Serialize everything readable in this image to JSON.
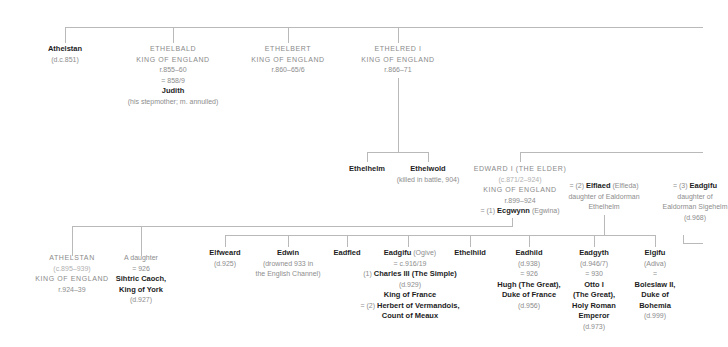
{
  "generation1": {
    "athelstan_elder": {
      "name": "Athelstan",
      "dates": "(d.c.851)"
    },
    "ethelbald": {
      "name": "ETHELBALD",
      "title": "KING OF ENGLAND",
      "reign": "r.855–60",
      "marriage": "= 858/9",
      "spouse": "Judith",
      "note": "(his stepmother; m. annulled)"
    },
    "ethelbert": {
      "name": "ETHELBERT",
      "title": "KING OF ENGLAND",
      "reign": "r.860–65/6"
    },
    "ethelred": {
      "name": "ETHELRED I",
      "title": "KING OF ENGLAND",
      "reign": "r.866–71"
    }
  },
  "generation2": {
    "ethelhelm": {
      "name": "Ethelhelm"
    },
    "ethelwold": {
      "name": "Ethelwold",
      "note": "(killed in battle, 904)"
    },
    "edward": {
      "name": "EDWARD I (THE ELDER)",
      "dates": "(c.871/2–924)",
      "title": "KING OF ENGLAND",
      "reign": "r.899–924",
      "marriage1_prefix": "= (1)",
      "marriage1_spouse": "Ecgwynn",
      "marriage1_alt": "(Egwina)"
    },
    "elflaed": {
      "prefix": "= (2)",
      "name": "Elflaed",
      "alt": "(Elfleda)",
      "line1": "daughter of Ealdorman",
      "line2": "Ethelhelm"
    },
    "eadgifu_wife": {
      "prefix": "= (3)",
      "name": "Eadgifu",
      "line1": "daughter of",
      "line2": "Ealdorman Sigehelm",
      "dates": "(d.968)"
    }
  },
  "generation3": {
    "athelstan": {
      "name": "ATHELSTAN",
      "dates": "(c.895–939)",
      "title": "KING OF ENGLAND",
      "reign": "r.924–39"
    },
    "daughter": {
      "name": "A daughter",
      "marriage": "= 926",
      "spouse1": "Sihtric Caoch,",
      "spouse2": "King of York",
      "dates": "(d.927)"
    },
    "elfweard": {
      "name": "Elfweard",
      "dates": "(d.925)"
    },
    "edwin": {
      "name": "Edwin",
      "note1": "(drowned 933 in",
      "note2": "the English Channel)"
    },
    "eadfled": {
      "name": "Eadfled"
    },
    "eadgifu": {
      "name": "Eadgifu",
      "alt": "(Ogive)",
      "marriage": "= c.916/19",
      "spouse1_prefix": "(1)",
      "spouse1": "Charles III (The Simple)",
      "spouse1_dates": "(d.929)",
      "spouse1_title": "King of France",
      "spouse2_prefix": "= (2)",
      "spouse2": "Herbert of Vermandois,",
      "spouse2_title": "Count of Meaux"
    },
    "ethelhild": {
      "name": "Ethelhild"
    },
    "eadhild": {
      "name": "Eadhild",
      "dates": "(d.938)",
      "marriage": "= 926",
      "spouse1": "Hugh (The Great),",
      "spouse2": "Duke of France",
      "spouse_dates": "(d.956)"
    },
    "eadgyth": {
      "name": "Eadgyth",
      "dates": "(d.946/7)",
      "marriage": "= 930",
      "spouse1": "Otto I",
      "spouse2": "(The Great),",
      "spouse3": "Holy Roman",
      "spouse4": "Emperor",
      "spouse_dates": "(d.973)"
    },
    "elgifu": {
      "name": "Elgifu",
      "alt": "(Adiva)",
      "marriage": "=",
      "spouse1": "Boleslaw II,",
      "spouse2": "Duke of",
      "spouse3": "Bohemia",
      "spouse_dates": "(d.999)"
    }
  },
  "colors": {
    "line": "#b9b9b9",
    "bold_text": "#1d1d1d",
    "muted_text": "#888888",
    "light_text": "#b0b0b0"
  }
}
